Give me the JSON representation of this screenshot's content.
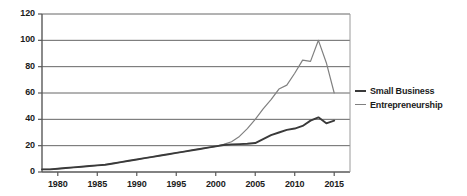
{
  "chart_data": {
    "type": "line",
    "title": "",
    "subtitle": "",
    "xlabel": "",
    "ylabel": "",
    "xlim": [
      1978,
      2017
    ],
    "ylim": [
      0,
      120
    ],
    "grid": true,
    "grid_axis": "y",
    "legend_position": "right",
    "xticks": [
      1980,
      1985,
      1990,
      1995,
      2000,
      2005,
      2010,
      2015
    ],
    "yticks": [
      0,
      20,
      40,
      60,
      80,
      100,
      120
    ],
    "x": [
      1978,
      1979,
      1980,
      1981,
      1982,
      1983,
      1984,
      1985,
      1986,
      1987,
      1988,
      1989,
      1990,
      1991,
      1992,
      1993,
      1994,
      1995,
      1996,
      1997,
      1998,
      1999,
      2000,
      2001,
      2002,
      2003,
      2004,
      2005,
      2006,
      2007,
      2008,
      2009,
      2010,
      2011,
      2012,
      2013,
      2014,
      2015
    ],
    "series": [
      {
        "name": "Small Business",
        "color": "#3a3a3a",
        "values": [
          2,
          2,
          2.5,
          3,
          3.5,
          4,
          4.5,
          5,
          5.5,
          6.5,
          7.5,
          8.5,
          9.5,
          10.5,
          11.5,
          12.5,
          13.5,
          14.5,
          15.5,
          16.5,
          17.5,
          18.5,
          19.5,
          20.5,
          21,
          21.2,
          21.5,
          22,
          25,
          28,
          30,
          32,
          33,
          35,
          39,
          41.5,
          37,
          39
        ]
      },
      {
        "name": "Entrepreneurship",
        "color": "#808080",
        "values": [
          2,
          2,
          2.5,
          3,
          3.5,
          4,
          4.5,
          5,
          5.5,
          6.5,
          7.5,
          8.5,
          9.5,
          10.5,
          11.5,
          12.5,
          13.5,
          14.5,
          15.5,
          16.5,
          17.5,
          18.5,
          19.5,
          21,
          23,
          27,
          33,
          40,
          48,
          55,
          63,
          66,
          75,
          85,
          84,
          100,
          83,
          60
        ]
      }
    ]
  },
  "axes": {
    "y_tick_labels": [
      "120",
      "100",
      "80",
      "60",
      "40",
      "20",
      "0"
    ],
    "x_tick_labels": [
      "1980",
      "1985",
      "1990",
      "1995",
      "2000",
      "2005",
      "2010",
      "2015"
    ]
  },
  "legend": {
    "items": [
      {
        "label": "Small Business",
        "color": "#3a3a3a"
      },
      {
        "label": "Entrepreneurship",
        "color": "#808080"
      }
    ]
  },
  "style": {
    "background": "#ffffff",
    "axis_color": "#595959",
    "grid_color": "#666666",
    "text_color": "#1b1b1b"
  }
}
